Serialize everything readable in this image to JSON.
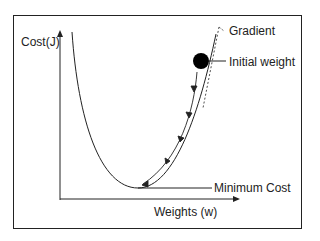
{
  "diagram": {
    "y_axis_label": "Cost(J)",
    "x_axis_label": "Weights (w)",
    "annotations": {
      "gradient": "Gradient",
      "initial_weight": "Initial weight",
      "minimum_cost": "Minimum Cost"
    },
    "colors": {
      "line": "#222222",
      "background": "#ffffff"
    }
  }
}
